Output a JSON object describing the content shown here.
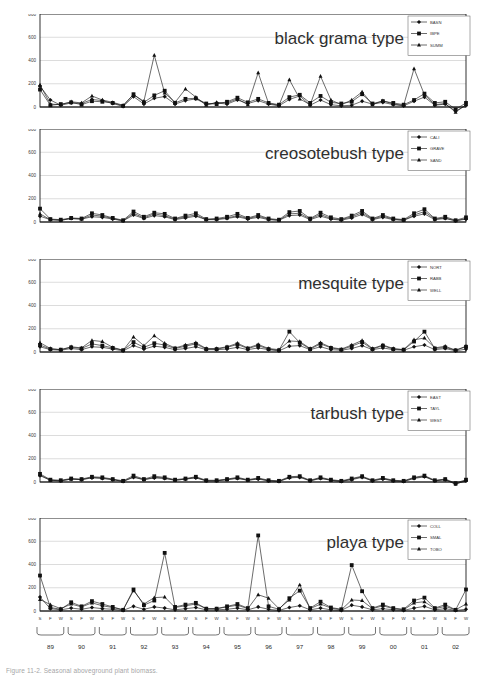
{
  "figure": {
    "caption": "Figure 11-2. Seasonal aboveground plant biomass."
  },
  "chart_data": [
    {
      "type": "line",
      "title": "black grama type",
      "xlabel": "",
      "ylabel": "",
      "ylim": [
        0,
        800
      ],
      "yticks": [
        0,
        200,
        400,
        600,
        800
      ],
      "grid": true,
      "legend_position": "top-right",
      "x": [
        "89 S",
        "89 F",
        "89 W",
        "90 S",
        "90 F",
        "90 W",
        "91 S",
        "91 F",
        "91 W",
        "92 S",
        "92 F",
        "92 W",
        "93 S",
        "93 F",
        "93 W",
        "94 S",
        "94 F",
        "94 W",
        "95 S",
        "95 F",
        "95 W",
        "96 S",
        "96 F",
        "96 W",
        "97 S",
        "97 F",
        "97 W",
        "98 S",
        "98 F",
        "98 W",
        "99 S",
        "99 F",
        "99 W",
        "00 S",
        "00 F",
        "00 W",
        "01 S",
        "01 F",
        "01 W",
        "02 S",
        "02 F",
        "02 W"
      ],
      "series": [
        {
          "name": "BASN",
          "marker": "diamond",
          "values": [
            180,
            60,
            15,
            35,
            30,
            65,
            55,
            30,
            5,
            90,
            25,
            75,
            90,
            25,
            55,
            70,
            25,
            35,
            25,
            60,
            30,
            55,
            25,
            10,
            65,
            95,
            15,
            60,
            20,
            10,
            15,
            50,
            25,
            40,
            20,
            10,
            50,
            85,
            15,
            25,
            -35,
            15
          ]
        },
        {
          "name": "IBPE",
          "marker": "square",
          "values": [
            150,
            15,
            25,
            40,
            20,
            50,
            45,
            35,
            10,
            110,
            40,
            100,
            140,
            35,
            70,
            75,
            30,
            25,
            45,
            80,
            40,
            70,
            35,
            20,
            85,
            105,
            35,
            95,
            40,
            30,
            45,
            110,
            30,
            50,
            35,
            20,
            60,
            115,
            35,
            45,
            -20,
            35
          ]
        },
        {
          "name": "SUMM",
          "marker": "triangle",
          "values": [
            190,
            25,
            20,
            45,
            35,
            95,
            60,
            40,
            15,
            105,
            50,
            445,
            120,
            40,
            155,
            85,
            15,
            40,
            35,
            70,
            20,
            295,
            30,
            15,
            235,
            70,
            20,
            265,
            60,
            20,
            60,
            130,
            20,
            55,
            25,
            15,
            330,
            105,
            20,
            30,
            -45,
            20
          ]
        }
      ]
    },
    {
      "type": "line",
      "title": "creosotebush type",
      "xlabel": "",
      "ylabel": "",
      "ylim": [
        0,
        800
      ],
      "yticks": [
        0,
        200,
        400,
        600,
        800
      ],
      "grid": true,
      "legend_position": "top-right",
      "x": [
        "89 S",
        "89 F",
        "89 W",
        "90 S",
        "90 F",
        "90 W",
        "91 S",
        "91 F",
        "91 W",
        "92 S",
        "92 F",
        "92 W",
        "93 S",
        "93 F",
        "93 W",
        "94 S",
        "94 F",
        "94 W",
        "95 S",
        "95 F",
        "95 W",
        "96 S",
        "96 F",
        "96 W",
        "97 S",
        "97 F",
        "97 W",
        "98 S",
        "98 F",
        "98 W",
        "99 S",
        "99 F",
        "99 W",
        "00 S",
        "00 F",
        "00 W",
        "01 S",
        "01 F",
        "01 W",
        "02 S",
        "02 F",
        "02 W"
      ],
      "series": [
        {
          "name": "CALI",
          "marker": "diamond",
          "values": [
            50,
            20,
            15,
            30,
            25,
            45,
            40,
            25,
            10,
            60,
            30,
            55,
            45,
            20,
            35,
            50,
            20,
            20,
            30,
            45,
            25,
            40,
            20,
            15,
            55,
            60,
            20,
            50,
            25,
            15,
            35,
            65,
            20,
            40,
            20,
            15,
            50,
            70,
            20,
            30,
            10,
            25
          ]
        },
        {
          "name": "GRAVE",
          "marker": "square",
          "values": [
            115,
            25,
            20,
            35,
            30,
            75,
            60,
            35,
            15,
            90,
            45,
            80,
            70,
            30,
            55,
            75,
            25,
            30,
            45,
            70,
            35,
            60,
            30,
            20,
            85,
            95,
            30,
            80,
            40,
            25,
            55,
            95,
            30,
            60,
            30,
            20,
            75,
            110,
            30,
            45,
            15,
            40
          ]
        },
        {
          "name": "SAND",
          "marker": "triangle",
          "values": [
            70,
            20,
            15,
            30,
            25,
            60,
            50,
            30,
            10,
            75,
            35,
            70,
            55,
            25,
            45,
            60,
            20,
            25,
            35,
            55,
            30,
            50,
            25,
            15,
            70,
            75,
            25,
            65,
            30,
            20,
            45,
            80,
            25,
            50,
            25,
            15,
            60,
            90,
            25,
            35,
            10,
            30
          ]
        }
      ]
    },
    {
      "type": "line",
      "title": "mesquite type",
      "xlabel": "",
      "ylabel": "",
      "ylim": [
        0,
        800
      ],
      "yticks": [
        0,
        200,
        400,
        600,
        800
      ],
      "grid": true,
      "legend_position": "top-right",
      "x": [
        "89 S",
        "89 F",
        "89 W",
        "90 S",
        "90 F",
        "90 W",
        "91 S",
        "91 F",
        "91 W",
        "92 S",
        "92 F",
        "92 W",
        "93 S",
        "93 F",
        "93 W",
        "94 S",
        "94 F",
        "94 W",
        "95 S",
        "95 F",
        "95 W",
        "96 S",
        "96 F",
        "96 W",
        "97 S",
        "97 F",
        "97 W",
        "98 S",
        "98 F",
        "98 W",
        "99 S",
        "99 F",
        "99 W",
        "00 S",
        "00 F",
        "00 W",
        "01 S",
        "01 F",
        "01 W",
        "02 S",
        "02 F",
        "02 W"
      ],
      "series": [
        {
          "name": "NORT",
          "marker": "diamond",
          "values": [
            45,
            20,
            15,
            30,
            20,
            45,
            40,
            25,
            10,
            55,
            25,
            50,
            40,
            20,
            30,
            45,
            20,
            20,
            25,
            40,
            20,
            35,
            20,
            10,
            50,
            55,
            20,
            45,
            20,
            15,
            30,
            55,
            20,
            35,
            20,
            15,
            45,
            60,
            20,
            30,
            10,
            25
          ]
        },
        {
          "name": "RABB",
          "marker": "square",
          "values": [
            60,
            25,
            20,
            40,
            30,
            70,
            55,
            35,
            15,
            85,
            40,
            75,
            60,
            30,
            50,
            70,
            25,
            25,
            40,
            65,
            30,
            55,
            25,
            15,
            175,
            80,
            25,
            70,
            35,
            20,
            50,
            85,
            25,
            55,
            25,
            20,
            90,
            175,
            30,
            40,
            15,
            45
          ]
        },
        {
          "name": "WELL",
          "marker": "triangle",
          "values": [
            80,
            30,
            20,
            45,
            35,
            100,
            90,
            40,
            15,
            130,
            55,
            140,
            75,
            35,
            60,
            80,
            30,
            30,
            45,
            75,
            35,
            65,
            30,
            20,
            95,
            90,
            30,
            80,
            40,
            25,
            60,
            100,
            30,
            60,
            30,
            20,
            105,
            120,
            35,
            50,
            15,
            50
          ]
        }
      ]
    },
    {
      "type": "line",
      "title": "tarbush type",
      "xlabel": "",
      "ylabel": "",
      "ylim": [
        0,
        800
      ],
      "yticks": [
        0,
        200,
        400,
        600,
        800
      ],
      "grid": true,
      "legend_position": "top-right",
      "x": [
        "89 S",
        "89 F",
        "89 W",
        "90 S",
        "90 F",
        "90 W",
        "91 S",
        "91 F",
        "91 W",
        "92 S",
        "92 F",
        "92 W",
        "93 S",
        "93 F",
        "93 W",
        "94 S",
        "94 F",
        "94 W",
        "95 S",
        "95 F",
        "95 W",
        "96 S",
        "96 F",
        "96 W",
        "97 S",
        "97 F",
        "97 W",
        "98 S",
        "98 F",
        "98 W",
        "99 S",
        "99 F",
        "99 W",
        "00 S",
        "00 F",
        "00 W",
        "01 S",
        "01 F",
        "01 W",
        "02 S",
        "02 F",
        "02 W"
      ],
      "series": [
        {
          "name": "EAST",
          "marker": "diamond",
          "values": [
            55,
            15,
            10,
            25,
            20,
            35,
            30,
            20,
            5,
            40,
            20,
            35,
            30,
            15,
            25,
            35,
            10,
            10,
            20,
            30,
            15,
            25,
            10,
            5,
            35,
            40,
            10,
            30,
            15,
            5,
            20,
            40,
            10,
            25,
            10,
            5,
            30,
            45,
            10,
            20,
            -15,
            10
          ]
        },
        {
          "name": "TAYL",
          "marker": "square",
          "values": [
            70,
            20,
            15,
            30,
            25,
            45,
            40,
            25,
            10,
            55,
            25,
            50,
            40,
            20,
            30,
            45,
            15,
            15,
            25,
            40,
            20,
            35,
            15,
            10,
            45,
            50,
            15,
            40,
            20,
            10,
            30,
            50,
            15,
            35,
            15,
            10,
            40,
            55,
            15,
            25,
            -10,
            20
          ]
        },
        {
          "name": "WEST",
          "marker": "triangle",
          "values": [
            60,
            15,
            10,
            25,
            20,
            40,
            35,
            20,
            5,
            45,
            20,
            40,
            35,
            15,
            25,
            40,
            10,
            10,
            20,
            35,
            15,
            30,
            10,
            5,
            40,
            45,
            10,
            35,
            15,
            5,
            25,
            45,
            10,
            30,
            10,
            5,
            35,
            50,
            10,
            20,
            -20,
            15
          ]
        }
      ]
    },
    {
      "type": "line",
      "title": "playa type",
      "xlabel": "",
      "ylabel": "",
      "ylim": [
        0,
        800
      ],
      "yticks": [
        0,
        200,
        400,
        600,
        800
      ],
      "grid": true,
      "legend_position": "top-right",
      "x": [
        "89 S",
        "89 F",
        "89 W",
        "90 S",
        "90 F",
        "90 W",
        "91 S",
        "91 F",
        "91 W",
        "92 S",
        "92 F",
        "92 W",
        "93 S",
        "93 F",
        "93 W",
        "94 S",
        "94 F",
        "94 W",
        "95 S",
        "95 F",
        "95 W",
        "96 S",
        "96 F",
        "96 W",
        "97 S",
        "97 F",
        "97 W",
        "98 S",
        "98 F",
        "98 W",
        "99 S",
        "99 F",
        "99 W",
        "00 S",
        "00 F",
        "00 W",
        "01 S",
        "01 F",
        "01 W",
        "02 S",
        "02 F",
        "02 W"
      ],
      "series": [
        {
          "name": "COLL",
          "marker": "diamond",
          "values": [
            120,
            20,
            10,
            25,
            15,
            30,
            20,
            15,
            5,
            40,
            15,
            35,
            25,
            10,
            20,
            30,
            10,
            10,
            15,
            25,
            10,
            35,
            15,
            5,
            30,
            45,
            10,
            25,
            10,
            5,
            50,
            35,
            10,
            20,
            10,
            5,
            25,
            40,
            10,
            20,
            5,
            15
          ]
        },
        {
          "name": "SMAL",
          "marker": "square",
          "values": [
            305,
            30,
            15,
            75,
            40,
            85,
            60,
            35,
            10,
            185,
            50,
            90,
            500,
            35,
            55,
            70,
            20,
            20,
            40,
            60,
            25,
            650,
            40,
            15,
            110,
            175,
            25,
            80,
            30,
            15,
            395,
            170,
            25,
            55,
            25,
            15,
            90,
            115,
            25,
            55,
            10,
            185
          ]
        },
        {
          "name": "TOBO",
          "marker": "triangle",
          "values": [
            100,
            55,
            20,
            60,
            35,
            70,
            45,
            30,
            10,
            175,
            60,
            115,
            120,
            30,
            45,
            60,
            20,
            20,
            35,
            50,
            20,
            140,
            110,
            20,
            95,
            225,
            20,
            60,
            25,
            10,
            95,
            90,
            20,
            45,
            20,
            10,
            70,
            80,
            20,
            40,
            10,
            60
          ]
        }
      ]
    }
  ],
  "axis": {
    "seasons": [
      "S",
      "F",
      "W",
      "S",
      "F",
      "W",
      "S",
      "F",
      "W",
      "S",
      "F",
      "W",
      "S",
      "F",
      "W",
      "S",
      "F",
      "W",
      "S",
      "F",
      "W",
      "S",
      "F",
      "W",
      "S",
      "F",
      "W",
      "S",
      "F",
      "W",
      "S",
      "F",
      "W",
      "S",
      "F",
      "W",
      "S",
      "F",
      "W",
      "S",
      "F",
      "W"
    ],
    "years": [
      "89",
      "90",
      "91",
      "92",
      "93",
      "94",
      "95",
      "96",
      "97",
      "98",
      "99",
      "00",
      "01",
      "02"
    ]
  }
}
